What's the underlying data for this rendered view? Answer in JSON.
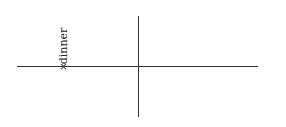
{
  "diagram": {
    "type": "axes-with-labeled-point",
    "axes": {
      "horizontal": {
        "x1": 17,
        "x2": 258,
        "y": 66
      },
      "vertical": {
        "x": 138,
        "y1": 16,
        "y2": 117
      }
    },
    "points": [
      {
        "marker": "×",
        "label": "dinner",
        "label_orientation": "vertical"
      }
    ]
  }
}
